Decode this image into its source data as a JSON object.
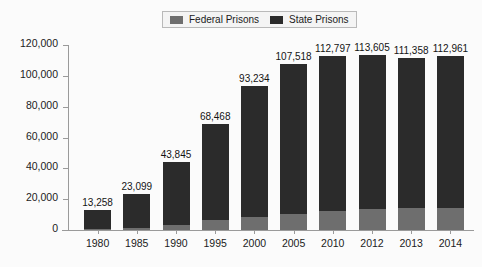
{
  "chart_data": {
    "type": "bar",
    "stacked": true,
    "title": "",
    "subtitle": "",
    "xlabel": "",
    "ylabel": "",
    "grid": false,
    "legend_position": "top-center",
    "categories": [
      "1980",
      "1985",
      "1990",
      "1995",
      "2000",
      "2005",
      "2010",
      "2012",
      "2013",
      "2014"
    ],
    "ylim": [
      0,
      120000
    ],
    "ytick_labels": [
      "120,000",
      "100,000",
      "80,000",
      "60,000",
      "40,000",
      "20,000",
      "0"
    ],
    "ytick_values": [
      120000,
      100000,
      80000,
      60000,
      40000,
      20000,
      0
    ],
    "totals": [
      13258,
      23099,
      43845,
      68468,
      93234,
      107518,
      112797,
      113605,
      111358,
      112961
    ],
    "total_labels": [
      "13,258",
      "23,099",
      "43,845",
      "68,468",
      "93,234",
      "107,518",
      "112,797",
      "113,605",
      "111,358",
      "112,961"
    ],
    "series": [
      {
        "name": "Federal Prisons",
        "color": "#6e6e6e",
        "values": [
          500,
          1100,
          3500,
          6500,
          8500,
          10500,
          12500,
          13500,
          14000,
          14500
        ]
      },
      {
        "name": "State Prisons",
        "color": "#2b2b2b",
        "values": [
          12758,
          21999,
          40345,
          61968,
          84734,
          97018,
          100297,
          100105,
          97358,
          98461
        ]
      }
    ]
  },
  "legend": {
    "items": [
      {
        "label": "Federal Prisons",
        "color": "#6e6e6e"
      },
      {
        "label": "State Prisons",
        "color": "#2b2b2b"
      }
    ]
  }
}
